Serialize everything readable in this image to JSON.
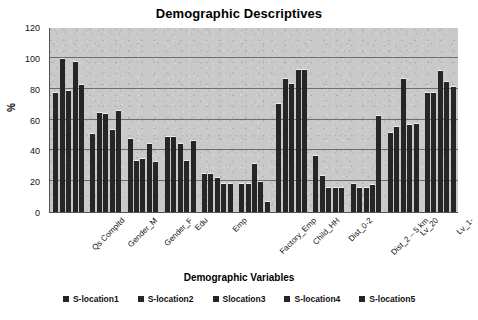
{
  "chart_data": {
    "type": "bar",
    "title": "Demographic Descriptives",
    "xlabel": "Demographic Variables",
    "ylabel": "%",
    "ylim": [
      0,
      120
    ],
    "yticks": [
      0,
      20,
      40,
      60,
      80,
      100,
      120
    ],
    "grid": true,
    "legend_position": "bottom",
    "categories": [
      "Qs Compltd",
      "Gender_M",
      "Gender_F",
      "Edu",
      "Emp",
      "Factory_Emp",
      "Child_HH",
      "Dist_0-2",
      "Dist_2 – 5 km",
      "Lv_20",
      "Lv_1-"
    ],
    "series": [
      {
        "name": "S-location1",
        "values": [
          78,
          51,
          48,
          49,
          25,
          19,
          71,
          37,
          19,
          52,
          78
        ]
      },
      {
        "name": "S-location2",
        "values": [
          100,
          65,
          34,
          49,
          25,
          19,
          87,
          24,
          16,
          56,
          78
        ]
      },
      {
        "name": "S-location3",
        "values": [
          79,
          64,
          35,
          45,
          23,
          32,
          84,
          16,
          16,
          87,
          92
        ]
      },
      {
        "name": "S-location4",
        "values": [
          98,
          54,
          45,
          34,
          19,
          20,
          93,
          16,
          18,
          57,
          85
        ]
      },
      {
        "name": "S-location5",
        "values": [
          83,
          66,
          33,
          47,
          19,
          7,
          93,
          16,
          63,
          58,
          82
        ]
      }
    ]
  },
  "legend": {
    "items": [
      {
        "label": "S-location1",
        "color": "#262626"
      },
      {
        "label": "S-location2",
        "color": "#262626"
      },
      {
        "label": "Slocation3",
        "color": "#262626"
      },
      {
        "label": "S-location4",
        "color": "#262626"
      },
      {
        "label": "S-location5",
        "color": "#262626"
      }
    ]
  },
  "style": {
    "plot_background": "#c9c9c9",
    "bar_color": "#262626",
    "gridline_color": "#6e6e6e",
    "axis_color": "#555555",
    "page_background": "#ffffff"
  }
}
